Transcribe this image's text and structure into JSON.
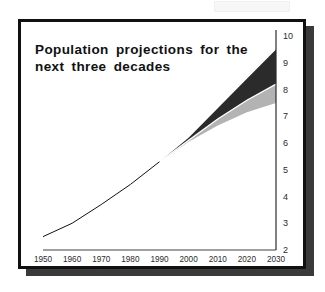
{
  "figure": {
    "title": "Population projections for the\nnext three decades",
    "frame_color": "#111111",
    "shadow_color": "#3a3a3a",
    "background_color": "#ffffff"
  },
  "chart_data": {
    "type": "area",
    "title": "Population projections for the next three decades",
    "xlabel": "",
    "ylabel": "",
    "xlim": [
      1950,
      2030
    ],
    "ylim": [
      2,
      10
    ],
    "grid": false,
    "legend": "none",
    "y_axis_position": "right",
    "xticks": [
      1950,
      1960,
      1970,
      1980,
      1990,
      2000,
      2010,
      2020,
      2030
    ],
    "xtick_labels": [
      "1950",
      "1960",
      "1970",
      "1980",
      "1990",
      "2000",
      "2010",
      "2020",
      "2030"
    ],
    "yticks": [
      2,
      3,
      4,
      5,
      6,
      7,
      8,
      9,
      10
    ],
    "ytick_labels": [
      "2",
      "3",
      "4",
      "5",
      "6",
      "7",
      "8",
      "9",
      "10"
    ],
    "x": [
      1950,
      1960,
      1970,
      1980,
      1990,
      2000,
      2010,
      2020,
      2030
    ],
    "series": [
      {
        "name": "historical",
        "kind": "line",
        "color": "#111111",
        "x": [
          1950,
          1960,
          1970,
          1980,
          1990
        ],
        "values": [
          2.5,
          3.0,
          3.7,
          4.45,
          5.3
        ]
      },
      {
        "name": "high projection",
        "kind": "upper-bound",
        "color": "#2b2b2b",
        "x": [
          1990,
          2000,
          2010,
          2020,
          2030
        ],
        "values": [
          5.3,
          6.2,
          7.3,
          8.4,
          9.5
        ]
      },
      {
        "name": "medium projection",
        "kind": "separator",
        "color": "#ffffff",
        "x": [
          1990,
          2000,
          2010,
          2020,
          2030
        ],
        "values": [
          5.3,
          6.1,
          6.9,
          7.6,
          8.2
        ]
      },
      {
        "name": "low projection",
        "kind": "lower-bound",
        "color": "#b3b3b3",
        "x": [
          1990,
          2000,
          2010,
          2020,
          2030
        ],
        "values": [
          5.3,
          6.05,
          6.65,
          7.15,
          7.5
        ]
      }
    ],
    "bands": [
      {
        "name": "high-medium band",
        "fill": "#2b2b2b",
        "upper_series": "high projection",
        "lower_series": "medium projection"
      },
      {
        "name": "medium-low band",
        "fill": "#b3b3b3",
        "upper_series": "medium projection",
        "lower_series": "low projection"
      }
    ],
    "annotations": [
      {
        "text": "Population projections for the next three decades",
        "role": "in-plot-title",
        "x": 1955,
        "y": 9.3
      }
    ]
  }
}
